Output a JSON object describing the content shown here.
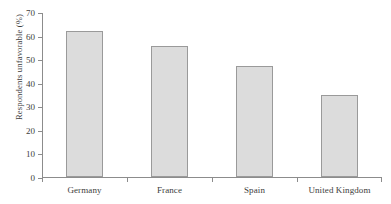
{
  "chart_data": {
    "type": "bar",
    "title": "",
    "xlabel": "",
    "ylabel": "Respondents unfavorable (%)",
    "categories": [
      "Germany",
      "France",
      "Spain",
      "United Kingdom"
    ],
    "values": [
      62,
      55.5,
      47,
      35
    ],
    "ylim": [
      0,
      70
    ],
    "yticks": [
      0,
      10,
      20,
      30,
      40,
      50,
      60,
      70
    ],
    "ytick_labels": [
      "0",
      "10",
      "20",
      "30",
      "40",
      "50",
      "60",
      "70"
    ],
    "grid": false,
    "legend": null,
    "bar_fill_color": "#dcdcdc",
    "bar_border_color": "#9a9a9a",
    "axis_color": "#8c8c8c",
    "text_color": "#3d3d3d"
  },
  "axes": {
    "y_title": "Respondents unfavorable (%)"
  },
  "artifacts": {
    "cropped_title_remnant": ""
  }
}
